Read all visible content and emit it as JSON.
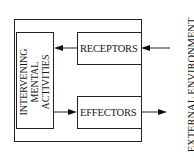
{
  "diagram": {
    "central": {
      "line1": "INTERVENING",
      "line2": "MENTAL",
      "line3": "ACTIVITIES"
    },
    "receptors": "RECEPTORS",
    "effectors": "EFFECTORS",
    "environment": "EXTERNAL ENVIRONMENT"
  }
}
